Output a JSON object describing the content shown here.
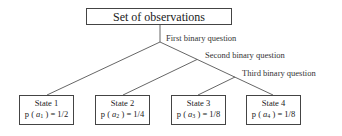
{
  "diagram": {
    "root": {
      "label": "Set of observations"
    },
    "questions": [
      {
        "label": "First binary question"
      },
      {
        "label": "Second binary question"
      },
      {
        "label": "Third binary question"
      }
    ],
    "states": [
      {
        "name": "State  1",
        "prob_prefix": "p (",
        "var": "a",
        "sub": "1",
        "prob_suffix": ") = 1/2"
      },
      {
        "name": "State  2",
        "prob_prefix": "p (",
        "var": "a",
        "sub": "2",
        "prob_suffix": ") = 1/4"
      },
      {
        "name": "State  3",
        "prob_prefix": "p (",
        "var": "a",
        "sub": "3",
        "prob_suffix": ") = 1/8"
      },
      {
        "name": "State  4",
        "prob_prefix": "p (",
        "var": "a",
        "sub": "4",
        "prob_suffix": ") = 1/8"
      }
    ],
    "colors": {
      "line": "#444444",
      "text": "#222222",
      "background": "#ffffff"
    }
  }
}
